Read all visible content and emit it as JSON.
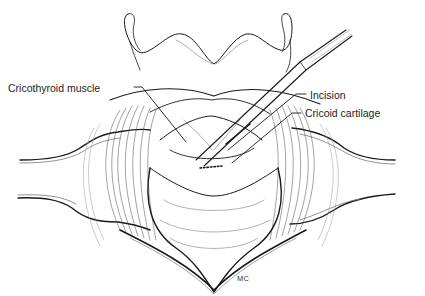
{
  "figure": {
    "labels": [
      {
        "id": "cricothyroid-muscle",
        "text": "Cricothyroid muscle"
      },
      {
        "id": "incision",
        "text": "Incision"
      },
      {
        "id": "cricoid-cartilage",
        "text": "Cricoid cartilage"
      }
    ],
    "signature": "MC",
    "colors": {
      "ink": "#1a1a1a",
      "background": "#ffffff",
      "label": "#222222"
    }
  }
}
